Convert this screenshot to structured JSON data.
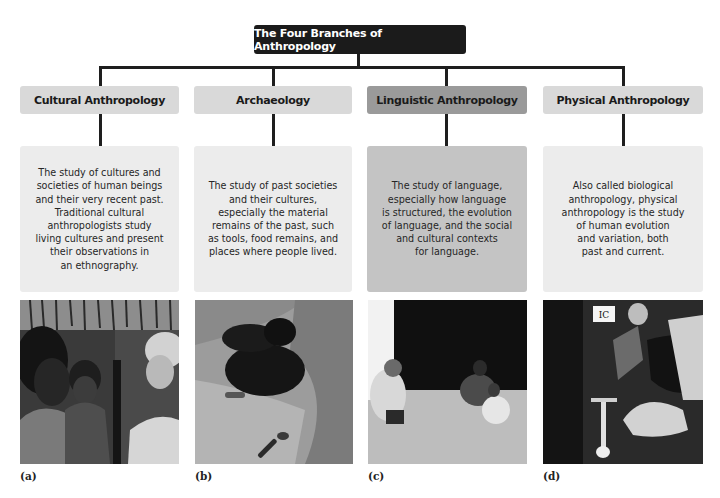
{
  "diagram": {
    "title": "The Four Branches of Anthropology",
    "colors": {
      "title_bg": "#1b1b1b",
      "title_text": "#ffffff",
      "connector": "#1e1e1e",
      "header_light": "#d9d9d9",
      "header_dark": "#9a9a9a",
      "desc_light": "#ececec",
      "desc_dark": "#c4c4c4"
    },
    "branches": [
      {
        "name": "Cultural Anthropology",
        "description": "The study of cultures and\nsocieties of human beings\nand their very recent past.\nTraditional cultural\nanthropologists study\nliving cultures and present\ntheir observations in\nan ethnography.",
        "photo_caption": "(a)",
        "photo_subject": "woman holding child speaking with anthropologist in village"
      },
      {
        "name": "Archaeology",
        "description": "The study of past societies\nand their cultures,\nespecially the material\nremains of the past, such\nas tools, food remains, and\nplaces where people lived.",
        "photo_caption": "(b)",
        "photo_subject": "archaeologist excavating sandy dig site with trowel"
      },
      {
        "name": "Linguistic Anthropology",
        "description": "The study of language,\nespecially how language\nis structured, the evolution\nof language, and the social\nand cultural contexts\nfor language.",
        "photo_caption": "(c)",
        "photo_subject": "researcher recording conversation with seated people"
      },
      {
        "name": "Physical Anthropology",
        "description": "Also called biological\nanthropology, physical\nanthropology is the study\nof human evolution\nand variation, both\npast and current.",
        "photo_caption": "(d)",
        "photo_subject": "researcher excavating human skeleton labeled IC"
      }
    ],
    "photo_d_label": "IC"
  }
}
